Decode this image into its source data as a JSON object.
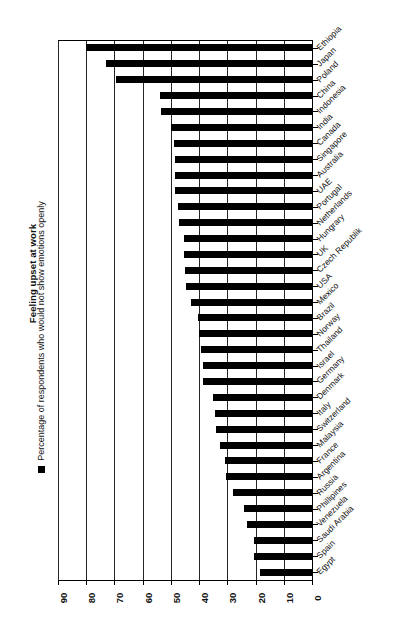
{
  "chart": {
    "title": "Feeling upset at work",
    "legend_label": "Percentage of respondents who would not show emotions openly",
    "legend_marker": "filled-square-marker"
  },
  "chart_data": {
    "type": "bar",
    "orientation": "horizontal",
    "title": "Feeling upset at work",
    "xlabel": "",
    "ylabel": "",
    "xlim": [
      90,
      0
    ],
    "x_axis_reversed": true,
    "grid": true,
    "legend_position": "left-outside",
    "series": [
      {
        "name": "Percentage of respondents who would not show emotions openly",
        "color": "#000000",
        "values": [
          80,
          73,
          69.5,
          54,
          53.5,
          50,
          49,
          48.5,
          48.5,
          48.5,
          47.5,
          47,
          45.5,
          45.5,
          45,
          44.5,
          43,
          40.5,
          40,
          39.5,
          38.5,
          38.5,
          35,
          34.5,
          34,
          32.5,
          31,
          30.5,
          28,
          24,
          23,
          20.5,
          20.5,
          18.5
        ]
      }
    ],
    "categories": [
      "Ethiopia",
      "Japan",
      "Poland",
      "China",
      "Indonesia",
      "India",
      "Canada",
      "Singapore",
      "Australia",
      "UAE",
      "Portugal",
      "Netherlands",
      "Hungrary",
      "UK",
      "Czech Republik",
      "USA",
      "Mexico",
      "Brazil",
      "Norway",
      "Thailand",
      "Israel",
      "Germany",
      "Denmark",
      "Italy",
      "Switzerland",
      "Malaysia",
      "France",
      "Argentina",
      "Russia",
      "Phillipines",
      "Venezuela",
      "Saudi Arabia",
      "Spain",
      "Egypt"
    ],
    "xticks": [
      90,
      80,
      70,
      60,
      50,
      40,
      30,
      20,
      10,
      0
    ],
    "xticklabels": [
      "90",
      "80",
      "70",
      "60",
      "50",
      "40",
      "30",
      "20",
      "10",
      "0"
    ]
  }
}
